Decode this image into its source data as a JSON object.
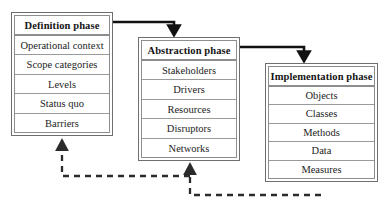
{
  "diagram": {
    "colors": {
      "background": "#ffffff",
      "box_border": "#6f6f6f",
      "row_divider": "#9a9a9a",
      "solid_arrow": "#111111",
      "dashed_arrow": "#2b2b2b",
      "text": "#141414"
    },
    "boxes": [
      {
        "id": "definition",
        "header": "Definition phase",
        "rows": [
          "Operational context",
          "Scope categories",
          "Levels",
          "Status quo",
          "Barriers"
        ]
      },
      {
        "id": "abstraction",
        "header": "Abstraction phase",
        "rows": [
          "Stakeholders",
          "Drivers",
          "Resources",
          "Disruptors",
          "Networks"
        ]
      },
      {
        "id": "implementation",
        "header": "Implementation phase",
        "rows": [
          "Objects",
          "Classes",
          "Methods",
          "Data",
          "Measures"
        ]
      }
    ],
    "connectors": [
      {
        "id": "definition-to-abstraction",
        "style": "solid",
        "from": "definition",
        "to": "abstraction",
        "direction": "forward"
      },
      {
        "id": "abstraction-to-implementation",
        "style": "solid",
        "from": "abstraction",
        "to": "implementation",
        "direction": "forward"
      },
      {
        "id": "abstraction-feedback-to-definition",
        "style": "dashed",
        "from": "abstraction",
        "to": "definition",
        "direction": "feedback"
      },
      {
        "id": "implementation-feedback-to-abstraction",
        "style": "dashed",
        "from": "implementation",
        "to": "abstraction",
        "direction": "feedback"
      }
    ]
  }
}
